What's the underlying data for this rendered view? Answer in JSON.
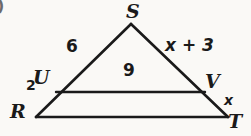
{
  "figure": {
    "type": "geometry-diagram",
    "problem_number": ")",
    "background_color": "#faf9f6",
    "stroke_color": "#1a1a1a",
    "text_color": "#1a1a1a",
    "canvas": {
      "width": 251,
      "height": 136
    },
    "vertices": [
      {
        "id": "S",
        "label": "S",
        "x": 131,
        "y": 24,
        "label_x": 126,
        "label_y": 2
      },
      {
        "id": "R",
        "label": "R",
        "x": 36,
        "y": 117,
        "label_x": 10,
        "label_y": 102
      },
      {
        "id": "T",
        "label": "T",
        "x": 228,
        "y": 117,
        "label_x": 228,
        "label_y": 112
      },
      {
        "id": "U",
        "label": "U",
        "x": 56,
        "y": 92,
        "label_x": 33,
        "label_y": 68
      },
      {
        "id": "V",
        "label": "V",
        "x": 205,
        "y": 92,
        "label_x": 205,
        "label_y": 72
      }
    ],
    "segments": [
      {
        "id": "RS",
        "from": "R",
        "to": "S"
      },
      {
        "id": "ST",
        "from": "S",
        "to": "T"
      },
      {
        "id": "RT",
        "from": "R",
        "to": "T"
      },
      {
        "id": "UV",
        "from": "U",
        "to": "V"
      }
    ],
    "measures": [
      {
        "id": "SU",
        "segment": "SU",
        "value": "6",
        "style": "measure",
        "x": 66,
        "y": 38
      },
      {
        "id": "SV",
        "segment": "SV",
        "value": "x + 3",
        "style": "expr",
        "x": 165,
        "y": 37
      },
      {
        "id": "UV",
        "segment": "UV",
        "value": "9",
        "style": "measure",
        "x": 123,
        "y": 62
      },
      {
        "id": "RU",
        "segment": "RU",
        "value": "2",
        "style": "measure-small",
        "x": 26,
        "y": 78
      },
      {
        "id": "VT",
        "segment": "VT",
        "value": "x",
        "style": "expr-small",
        "x": 224,
        "y": 93
      }
    ]
  }
}
